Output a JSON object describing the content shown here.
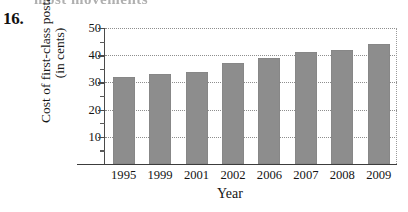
{
  "problem": {
    "number": "16.",
    "scan_artifact_text": "most movements"
  },
  "chart_data": {
    "type": "bar",
    "title": "",
    "xlabel": "Year",
    "ylabel": "Cost of first-class postage (in cents)",
    "ylabel_line1": "Cost of first-class postage",
    "ylabel_line2": "(in cents)",
    "categories": [
      "1995",
      "1999",
      "2001",
      "2002",
      "2006",
      "2007",
      "2008",
      "2009"
    ],
    "values": [
      32,
      33,
      34,
      37,
      39,
      41,
      42,
      44
    ],
    "ylim": [
      0,
      50
    ],
    "ytick_labels": [
      "10",
      "20",
      "30",
      "40",
      "50"
    ],
    "ytick_values": [
      10,
      20,
      30,
      40,
      50
    ],
    "yminor_values": [
      5,
      15,
      25,
      35,
      45
    ],
    "grid": true,
    "grid_style": "dotted",
    "legend": "none",
    "bar_color": "#8d8d8d",
    "axis_color": "#3c3c3c",
    "gridline_color": "#8e8e8e"
  }
}
